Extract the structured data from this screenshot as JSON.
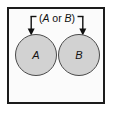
{
  "figure": {
    "type": "venn-diagram",
    "background_color": "#ffffff"
  },
  "universe": {
    "name": "sample-space-box",
    "border_color": "#1c1c1c",
    "fill_color": "#fbfbfb"
  },
  "annotation": {
    "open_paren": "(",
    "first_set": "A",
    "connector": " or ",
    "second_set": "B",
    "close_paren": ")",
    "full_text": "(A or B)",
    "bracket_color": "#101010",
    "arrow_count": 2
  },
  "sets": [
    {
      "id": "A",
      "label": "A",
      "fill_color": "#d2d2d2",
      "stroke_color": "#4a4a4a"
    },
    {
      "id": "B",
      "label": "B",
      "fill_color": "#d2d2d2",
      "stroke_color": "#4a4a4a"
    }
  ]
}
